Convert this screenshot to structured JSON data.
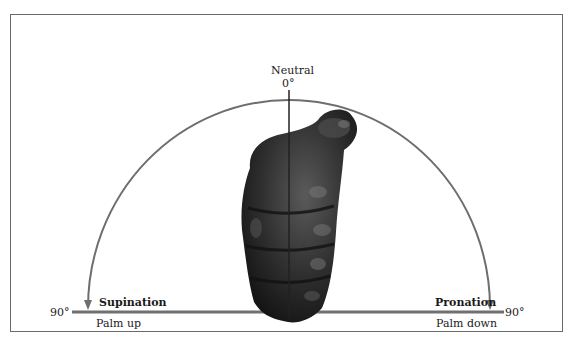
{
  "diagram": {
    "top_label": "Neutral",
    "top_angle": "0°",
    "left_angle": "90°",
    "right_angle": "90°",
    "left": {
      "movement": "Supination",
      "description": "Palm up"
    },
    "right": {
      "movement": "Pronation",
      "description": "Palm down"
    },
    "colors": {
      "frame": "#6a6a6a",
      "arc": "#6e6e6e",
      "baseline": "#707070",
      "axis": "#222222",
      "fist_dark": "#1e1e1e",
      "fist_mid": "#3c3c3c",
      "fist_light": "#6a6a6a"
    },
    "icons": [
      "arrow-down-left-icon",
      "arrow-down-right-icon",
      "fist-illustration"
    ]
  }
}
